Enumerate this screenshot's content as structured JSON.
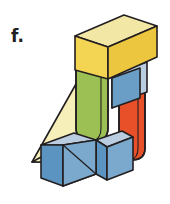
{
  "figure": {
    "label": "f.",
    "caption_letter": "f",
    "kind": "isometric-block-assembly",
    "background_color": "#ffffff",
    "outline_color": "#231f20",
    "parts": [
      {
        "id": "yellow-box",
        "name": "yellow rectangular block",
        "position": "top",
        "shape": "cuboid",
        "top_face_color": "#f3e7a6",
        "front_face_color": "#f4d453",
        "side_face_color": "#edc63f"
      },
      {
        "id": "blue-cube-upper-right",
        "name": "blue cube upper right",
        "position": "right-upper",
        "shape": "cube",
        "top_face_color": "#b9cce0",
        "front_face_color": "#6b9ec6",
        "side_face_color": "#4f83ae"
      },
      {
        "id": "green-cylinder",
        "name": "green cylinder",
        "position": "center",
        "shape": "cylinder",
        "body_color": "#9cc054",
        "top_face_color": "#b7cf74",
        "shade_color": "#86ab46"
      },
      {
        "id": "red-cylinder",
        "name": "red cylinder",
        "position": "right-lower",
        "shape": "cylinder",
        "body_color": "#e8502a",
        "shade_color": "#cf3f1f"
      },
      {
        "id": "pale-yellow-wedge",
        "name": "pale yellow triangular wedge",
        "position": "back-left",
        "shape": "triangular-prism",
        "face_color": "#f7efb9",
        "side_color": "#efe296"
      },
      {
        "id": "blue-cube-front-left",
        "name": "blue cube front left",
        "position": "bottom-left",
        "shape": "cube",
        "top_face_color": "#b9cce0",
        "front_face_color": "#5b94c0",
        "side_face_color": "#7aa9cd"
      },
      {
        "id": "orange-wedge",
        "name": "orange triangular wedge",
        "position": "bottom-center",
        "shape": "triangular-prism",
        "face_color": "#ef8a56"
      },
      {
        "id": "blue-cube-front-right",
        "name": "blue cube front right",
        "position": "bottom-right",
        "shape": "cube",
        "top_face_color": "#b9cce0",
        "front_face_color": "#7aa9cd",
        "side_face_color": "#5b94c0"
      }
    ]
  }
}
